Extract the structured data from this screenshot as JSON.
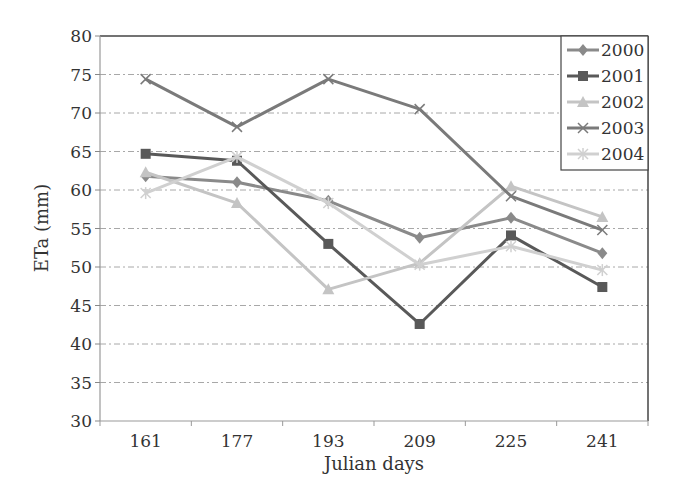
{
  "chart_data": {
    "type": "line",
    "title": "",
    "xlabel": "Julian days",
    "ylabel": "ETa (mm)",
    "categories": [
      "161",
      "177",
      "193",
      "209",
      "225",
      "241"
    ],
    "ylim": [
      30,
      80
    ],
    "yticks": [
      30,
      35,
      40,
      45,
      50,
      55,
      60,
      65,
      70,
      75,
      80
    ],
    "grid": {
      "y": true,
      "x": false,
      "style": "dash-dot"
    },
    "legend_position": "top-right-inside",
    "series": [
      {
        "name": "2000",
        "marker": "diamond",
        "color": "#8a8a8a",
        "values": [
          61.8,
          61.0,
          58.6,
          53.8,
          56.4,
          51.8
        ]
      },
      {
        "name": "2001",
        "marker": "square",
        "color": "#595959",
        "values": [
          64.7,
          63.8,
          53.0,
          42.6,
          54.1,
          47.4
        ]
      },
      {
        "name": "2002",
        "marker": "triangle",
        "color": "#c4c4c4",
        "values": [
          62.3,
          58.3,
          47.1,
          50.5,
          60.5,
          56.5
        ]
      },
      {
        "name": "2003",
        "marker": "x",
        "color": "#7a7a7a",
        "values": [
          74.4,
          68.2,
          74.4,
          70.5,
          59.2,
          54.8
        ]
      },
      {
        "name": "2004",
        "marker": "asterisk",
        "color": "#d0d0d0",
        "values": [
          59.6,
          64.3,
          58.3,
          50.3,
          52.7,
          49.6
        ]
      }
    ]
  }
}
